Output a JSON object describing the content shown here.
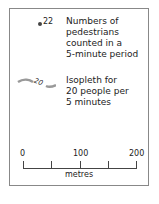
{
  "legend": {
    "dot_value": "22",
    "dot_description": "Numbers of\npedestrians\ncounted in a\n5-minute period",
    "isopleth_value": "20",
    "isopleth_description": "Isopleth for\n20 people per\n5 minutes"
  },
  "scale_bar": {
    "labels": [
      "0",
      "100",
      "200"
    ],
    "units": "metres"
  },
  "colors": {
    "border": "#888888",
    "line": "#999999",
    "text": "#222222"
  }
}
